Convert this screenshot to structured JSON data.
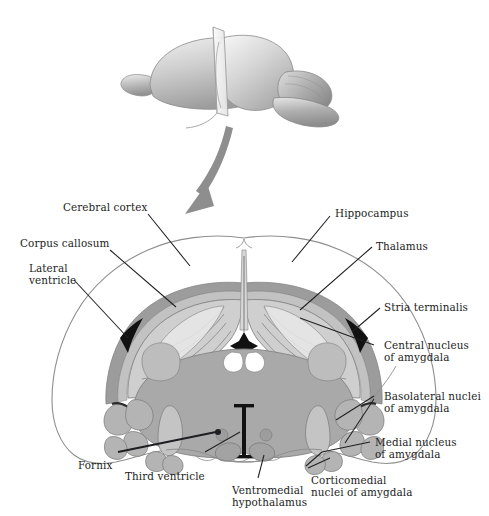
{
  "figure": {
    "type": "anatomical-diagram",
    "colors": {
      "background": "#ffffff",
      "outline": "#8c8c8c",
      "ink": "#1c1c22",
      "cortex_rim": "#9a9a9a",
      "corpus_callosum": "#b9b9b9",
      "hippocampus_fill": "#cfcfcf",
      "thalamus_fill": "#a9a9a9",
      "amygdala_fill": "#b4b4b4",
      "ventricle_black": "#111111",
      "arrow": "#8e8e8e",
      "brain3d_light": "#e2e2e2",
      "brain3d_mid": "#b5b5b5",
      "brain3d_dark": "#8f8f8f",
      "plane": "#f2f2f2"
    }
  },
  "inset": {
    "name": "3d-brain-with-section-plane",
    "description": "Three-dimensional rat brain viewed from the side with a vertical cutting plane through the forebrain, indicating the level of the coronal section shown below."
  },
  "arrow": {
    "name": "section-direction-arrow",
    "description": "Curved arrow pointing down and to the left, from the three-dimensional brain toward the coronal section."
  },
  "labels": [
    {
      "id": "cerebral-cortex",
      "text": "Cerebral cortex"
    },
    {
      "id": "corpus-callosum",
      "text": "Corpus callosum"
    },
    {
      "id": "lateral-ventricle",
      "text": "Lateral\nventricle"
    },
    {
      "id": "hippocampus",
      "text": "Hippocampus"
    },
    {
      "id": "thalamus",
      "text": "Thalamus"
    },
    {
      "id": "stria-terminalis",
      "text": "Stria terminalis"
    },
    {
      "id": "central-nucleus",
      "text": "Central nucleus\nof amygdala"
    },
    {
      "id": "basolateral-nuclei",
      "text": "Basolateral nuclei\nof amygdala"
    },
    {
      "id": "medial-nucleus",
      "text": "Medial nucleus\nof amygdala"
    },
    {
      "id": "corticomedial-nuclei",
      "text": "Corticomedial\nnuclei of amygdala"
    },
    {
      "id": "ventromedial-hypothalamus",
      "text": "Ventromedial\nhypothalamus"
    },
    {
      "id": "third-ventricle",
      "text": "Third ventricle"
    },
    {
      "id": "fornix",
      "text": "Fornix"
    }
  ]
}
